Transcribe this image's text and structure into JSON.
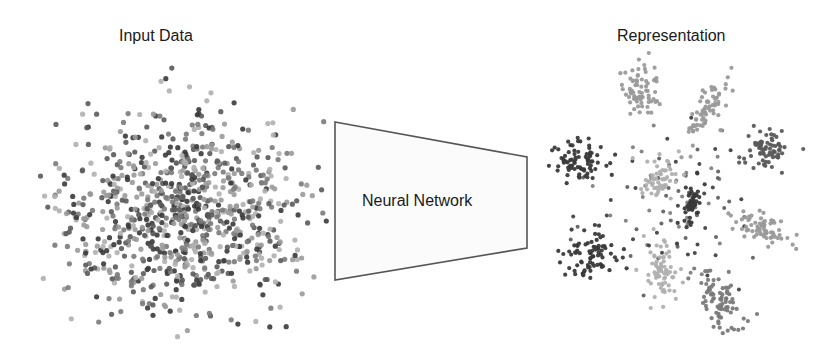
{
  "titles": {
    "input": "Input Data",
    "representation": "Representation",
    "network": "Neural Network"
  },
  "colors": {
    "background": "#ffffff",
    "text": "#1a1a1a",
    "network_stroke": "#555555",
    "network_fill": "#fbfbfb",
    "point_shades": [
      "#3a3a3a",
      "#5a5a5a",
      "#7a7a7a",
      "#9a9a9a",
      "#b0b0b0"
    ]
  },
  "network": {
    "shape": "trapezoid",
    "points": [
      [
        335,
        122
      ],
      [
        527,
        157
      ],
      [
        527,
        248
      ],
      [
        335,
        280
      ]
    ]
  },
  "input_cloud": {
    "center": [
      185,
      215
    ],
    "spread": [
      62,
      48
    ],
    "count": 900,
    "radius": 2.6,
    "bounds": [
      40,
      55,
      330,
      345
    ]
  },
  "representation_clusters": [
    {
      "center": [
        640,
        90
      ],
      "spread": [
        9,
        14
      ],
      "angle": -20,
      "count": 70,
      "shade": 3
    },
    {
      "center": [
        705,
        110
      ],
      "spread": [
        6,
        20
      ],
      "angle": 30,
      "count": 70,
      "shade": 3
    },
    {
      "center": [
        765,
        150
      ],
      "spread": [
        10,
        9
      ],
      "angle": 0,
      "count": 70,
      "shade": 1
    },
    {
      "center": [
        580,
        160
      ],
      "spread": [
        13,
        10
      ],
      "angle": 20,
      "count": 80,
      "shade": 0
    },
    {
      "center": [
        660,
        180
      ],
      "spread": [
        9,
        12
      ],
      "angle": 0,
      "count": 60,
      "shade": 4
    },
    {
      "center": [
        692,
        205
      ],
      "spread": [
        5,
        11
      ],
      "angle": 15,
      "count": 50,
      "shade": 0
    },
    {
      "center": [
        760,
        228
      ],
      "spread": [
        15,
        7
      ],
      "angle": 20,
      "count": 70,
      "shade": 3
    },
    {
      "center": [
        590,
        255
      ],
      "spread": [
        15,
        11
      ],
      "angle": -25,
      "count": 80,
      "shade": 0
    },
    {
      "center": [
        660,
        270
      ],
      "spread": [
        8,
        16
      ],
      "angle": 0,
      "count": 70,
      "shade": 4
    },
    {
      "center": [
        720,
        300
      ],
      "spread": [
        9,
        18
      ],
      "angle": -30,
      "count": 80,
      "shade": 2
    }
  ],
  "representation_scatter": {
    "center": [
      675,
      200
    ],
    "spread": [
      45,
      45
    ],
    "count": 90,
    "radius": 2.0
  }
}
